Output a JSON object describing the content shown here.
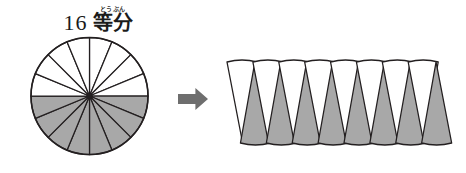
{
  "page": {
    "background_color": "#ffffff",
    "width": 466,
    "height": 173
  },
  "title": {
    "number": "16",
    "ruby_base": "等分",
    "ruby_reading": "とうぶん",
    "full_text": "16 等分"
  },
  "colors": {
    "shaded_fill": "#a8a8a8",
    "unshaded_fill": "#ffffff",
    "outline": "#231f20",
    "arrow_fill": "#6e6e6e",
    "text": "#1b1b1b"
  },
  "arrow": {
    "direction": "right",
    "label": "transforms-into"
  },
  "chart_data": {
    "type": "pie",
    "categories": [
      "shaded",
      "unshaded"
    ],
    "values": [
      8,
      8
    ],
    "total_slices": 16,
    "slice_angle_degrees": 22.5,
    "shaded_slices": 8,
    "unshaded_slices": 8,
    "fraction_shaded": "8/16",
    "legend": [],
    "grid": false,
    "circle": {
      "center_x": 89.5,
      "center_y": 96,
      "radius": 58.5,
      "shaded_half": "bottom",
      "unshaded_half": "top"
    },
    "rearranged_strip": {
      "description": "16 sectors rearranged into an alternating parallelogram strip",
      "count": 16,
      "alternating_pattern": [
        "unshaded",
        "shaded"
      ],
      "left_x": 227,
      "right_x": 447,
      "top_y": 62,
      "bottom_y": 143,
      "sector_width": 27.5
    }
  }
}
